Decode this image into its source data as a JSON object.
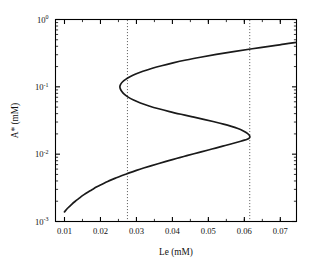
{
  "figure": {
    "background_color": "#ffffff",
    "line_color": "#1a1a1a",
    "guide_color": "#555555",
    "axis_color": "#000000"
  },
  "chart_data": {
    "type": "line",
    "title": "",
    "subtitle": "",
    "xlabel": "Le (mM)",
    "ylabel": "A* (mM)",
    "ylabel_parts": {
      "symbol": "A* ",
      "units": "(mM)"
    },
    "xscale": "linear",
    "yscale": "log",
    "xlim": [
      0.0075,
      0.0745
    ],
    "ylim": [
      0.001,
      1.0
    ],
    "grid": false,
    "legend": null,
    "xticks": [
      0.01,
      0.02,
      0.03,
      0.04,
      0.05,
      0.06,
      0.07
    ],
    "xticklabels": [
      "0.01",
      "0.02",
      "0.03",
      "0.04",
      "0.05",
      "0.06",
      "0.07"
    ],
    "yticks": [
      0.001,
      0.01,
      0.1,
      1.0
    ],
    "yticklabels": [
      "10-3",
      "10-2",
      "10-1",
      "100"
    ],
    "yticklabel_mantissa": "10",
    "yticklabel_exponents": [
      "-3",
      "-2",
      "-1",
      "0"
    ],
    "series": [
      {
        "name": "steady-state branch",
        "style": "solid",
        "color": "#1a1a1a",
        "comment": "S-shaped bistability curve, A* vs Le",
        "points": [
          [
            0.01,
            0.00139
          ],
          [
            0.011,
            0.0016
          ],
          [
            0.012,
            0.0018
          ],
          [
            0.013,
            0.002
          ],
          [
            0.014,
            0.0022
          ],
          [
            0.015,
            0.00242
          ],
          [
            0.016,
            0.00263
          ],
          [
            0.017,
            0.00284
          ],
          [
            0.018,
            0.00305
          ],
          [
            0.019,
            0.00327
          ],
          [
            0.02,
            0.00349
          ],
          [
            0.021,
            0.00371
          ],
          [
            0.022,
            0.00393
          ],
          [
            0.023,
            0.00415
          ],
          [
            0.024,
            0.00437
          ],
          [
            0.025,
            0.00459
          ],
          [
            0.026,
            0.00481
          ],
          [
            0.027,
            0.00504
          ],
          [
            0.028,
            0.00527
          ],
          [
            0.03,
            0.00574
          ],
          [
            0.032,
            0.00622
          ],
          [
            0.034,
            0.00671
          ],
          [
            0.036,
            0.00722
          ],
          [
            0.038,
            0.00775
          ],
          [
            0.04,
            0.0083
          ],
          [
            0.042,
            0.00888
          ],
          [
            0.044,
            0.0095
          ],
          [
            0.046,
            0.01015
          ],
          [
            0.048,
            0.01083
          ],
          [
            0.05,
            0.01155
          ],
          [
            0.052,
            0.01232
          ],
          [
            0.054,
            0.01315
          ],
          [
            0.056,
            0.01405
          ],
          [
            0.0575,
            0.01478
          ],
          [
            0.059,
            0.01557
          ],
          [
            0.06,
            0.01615
          ],
          [
            0.0608,
            0.0167
          ],
          [
            0.0613,
            0.0172
          ],
          [
            0.0615,
            0.0178
          ],
          [
            0.0615,
            0.0186
          ],
          [
            0.0612,
            0.0196
          ],
          [
            0.0606,
            0.0208
          ],
          [
            0.0596,
            0.0223
          ],
          [
            0.0582,
            0.024
          ],
          [
            0.0564,
            0.0259
          ],
          [
            0.0542,
            0.028
          ],
          [
            0.0516,
            0.0303
          ],
          [
            0.0487,
            0.0329
          ],
          [
            0.0456,
            0.0358
          ],
          [
            0.0424,
            0.0391
          ],
          [
            0.0392,
            0.0429
          ],
          [
            0.0362,
            0.0472
          ],
          [
            0.0335,
            0.052
          ],
          [
            0.0311,
            0.0574
          ],
          [
            0.0292,
            0.0635
          ],
          [
            0.0277,
            0.0703
          ],
          [
            0.0266,
            0.0779
          ],
          [
            0.0259,
            0.086
          ],
          [
            0.0255,
            0.094
          ],
          [
            0.0254,
            0.101
          ],
          [
            0.0256,
            0.109
          ],
          [
            0.0261,
            0.118
          ],
          [
            0.027,
            0.129
          ],
          [
            0.0282,
            0.141
          ],
          [
            0.0298,
            0.155
          ],
          [
            0.0318,
            0.17
          ],
          [
            0.0342,
            0.187
          ],
          [
            0.037,
            0.206
          ],
          [
            0.0402,
            0.227
          ],
          [
            0.0438,
            0.25
          ],
          [
            0.0478,
            0.275
          ],
          [
            0.0522,
            0.303
          ],
          [
            0.057,
            0.334
          ],
          [
            0.0622,
            0.368
          ],
          [
            0.0678,
            0.405
          ],
          [
            0.071,
            0.43
          ],
          [
            0.0745,
            0.458
          ]
        ]
      }
    ],
    "annotations": [
      {
        "type": "vline",
        "name": "lower-fold-guide",
        "x": 0.0275,
        "style": "dotted",
        "label": ""
      },
      {
        "type": "vline",
        "name": "upper-fold-guide",
        "x": 0.0615,
        "style": "dotted",
        "label": ""
      }
    ],
    "fold_points": [
      {
        "name": "left-fold",
        "x": 0.0254,
        "y": 0.101
      },
      {
        "name": "right-fold",
        "x": 0.0615,
        "y": 0.0178
      }
    ]
  }
}
